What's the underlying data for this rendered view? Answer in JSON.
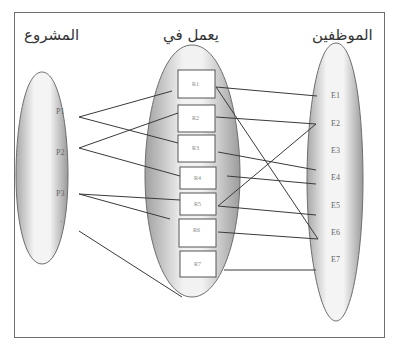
{
  "diagram": {
    "type": "mapping-relationship",
    "sets": {
      "projects": {
        "title": "المشروع",
        "items": [
          "P1",
          "P2",
          "P3",
          "."
        ]
      },
      "works_on": {
        "title": "يعمل في",
        "items": [
          "R1",
          "R2",
          "R3",
          "R4",
          "R5",
          "R6",
          "R7"
        ]
      },
      "employees": {
        "title": "الموظفين",
        "items": [
          "E1",
          "E2",
          "E3",
          "E4",
          "E5",
          "E6",
          "E7"
        ]
      }
    },
    "edges_project_to_relation": [
      [
        "P1",
        "R1"
      ],
      [
        "P1",
        "R3"
      ],
      [
        "P2",
        "R2"
      ],
      [
        "P2",
        "R4"
      ],
      [
        "P3",
        "R5"
      ],
      [
        "P3",
        "R6"
      ],
      [
        ".",
        "R7"
      ]
    ],
    "edges_relation_to_employee": [
      [
        "R1",
        "E1"
      ],
      [
        "R1",
        "E6"
      ],
      [
        "R2",
        "E2"
      ],
      [
        "R3",
        "E3"
      ],
      [
        "R4",
        "E4"
      ],
      [
        "R5",
        "E2"
      ],
      [
        "R5",
        "E5"
      ],
      [
        "R6",
        "E6"
      ],
      [
        "R7",
        "E7"
      ]
    ],
    "colors": {
      "border": "#6e6e6e",
      "line": "#3a3a3a",
      "ellipse_shade": "#9a9a9a",
      "ellipse_light": "#ffffff"
    }
  }
}
